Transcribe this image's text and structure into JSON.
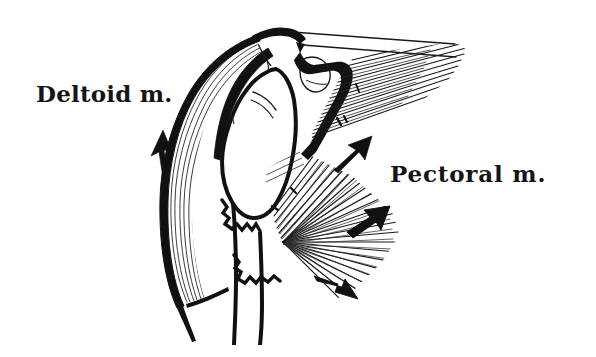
{
  "figure": {
    "type": "anatomical-line-drawing",
    "background_color": "#ffffff",
    "ink_color": "#111111"
  },
  "labels": {
    "deltoid": "Deltoid m.",
    "pectoral": "Pectoral m."
  },
  "structures": {
    "deltoid_muscle": "deltoid-muscle",
    "pectoral_muscle": "pectoral-muscle",
    "clavicle": "clavicle",
    "acromion": "acromion",
    "humeral_head": "humeral-head",
    "humerus_shaft": "humerus-shaft",
    "coracoid": "coracoid-process",
    "cut_edge": "jagged-cut-edge"
  },
  "arrows": [
    {
      "name": "deltoid-force-arrow",
      "direction": "up",
      "region": "deltoid"
    },
    {
      "name": "pectoral-force-arrow-upper",
      "direction": "up-right",
      "region": "pectoral"
    },
    {
      "name": "pectoral-force-arrow-middle",
      "direction": "up-right",
      "region": "pectoral"
    },
    {
      "name": "pectoral-force-arrow-lower",
      "direction": "down-right",
      "region": "pectoral"
    }
  ]
}
